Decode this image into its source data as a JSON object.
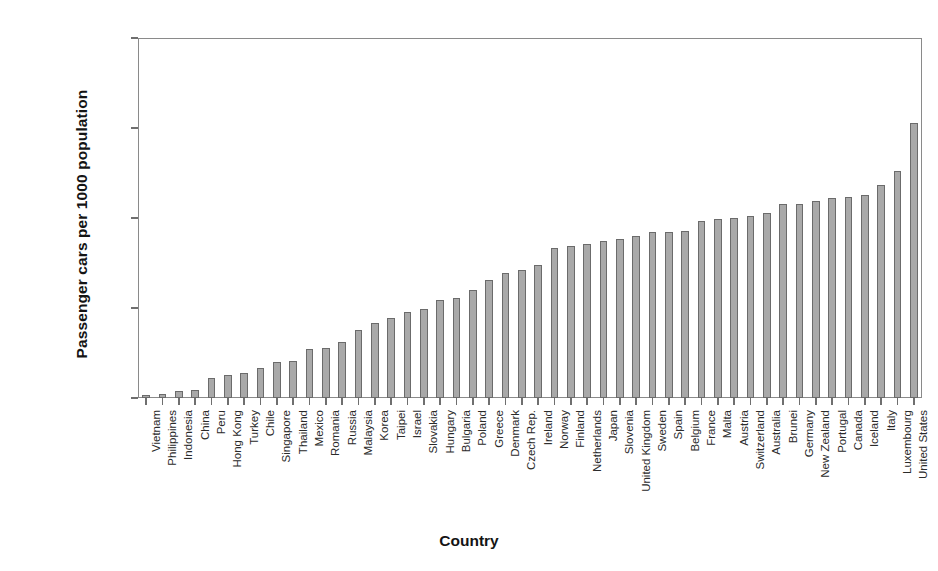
{
  "chart_data": {
    "type": "bar",
    "title": "",
    "subtitle": "",
    "xlabel": "Country",
    "ylabel": "Passenger cars per 1000 population",
    "ylim": [
      0,
      1000
    ],
    "yticks": [
      0,
      250,
      500,
      750,
      1000
    ],
    "ytick_labels": [
      "0",
      "250",
      "500",
      "750",
      "1000"
    ],
    "grid": false,
    "legend": null,
    "bar_color": "#a9a9a9",
    "bar_edge_color": "#6b6b6b",
    "categories": [
      "Vietnam",
      "Philippines",
      "Indonesia",
      "China",
      "Peru",
      "Hong Kong",
      "Turkey",
      "Chile",
      "Singapore",
      "Thailand",
      "Mexico",
      "Romania",
      "Russia",
      "Malaysia",
      "Korea",
      "Taipei",
      "Israel",
      "Slovakia",
      "Hungary",
      "Bulgaria",
      "Poland",
      "Greece",
      "Denmark",
      "Czech Rep.",
      "Ireland",
      "Norway",
      "Finland",
      "Netherlands",
      "Japan",
      "Slovenia",
      "United Kingdom",
      "Sweden",
      "Spain",
      "Belgium",
      "France",
      "Malta",
      "Austria",
      "Switzerland",
      "Australia",
      "Brunei",
      "Germany",
      "New Zealand",
      "Portugal",
      "Canada",
      "Iceland",
      "Italy",
      "Luxembourg",
      "United States"
    ],
    "values": [
      8,
      12,
      20,
      22,
      55,
      63,
      70,
      82,
      100,
      103,
      135,
      140,
      155,
      190,
      207,
      222,
      240,
      248,
      272,
      278,
      300,
      328,
      348,
      355,
      370,
      418,
      422,
      428,
      435,
      443,
      450,
      460,
      460,
      465,
      492,
      496,
      500,
      505,
      515,
      540,
      540,
      548,
      555,
      558,
      563,
      592,
      630,
      765
    ]
  }
}
